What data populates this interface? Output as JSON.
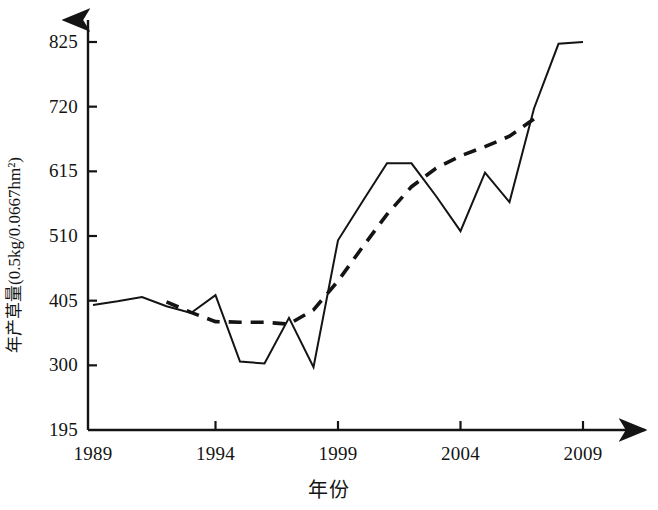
{
  "chart_data": {
    "type": "line",
    "title": "",
    "xlabel": "年份",
    "ylabel": "年产草量(0.5kg/0.0667hm²)",
    "xlim": [
      1989,
      2009
    ],
    "ylim": [
      195,
      825
    ],
    "grid": false,
    "legend": "none",
    "x_ticks": [
      "1989",
      "1994",
      "1999",
      "2004",
      "2009"
    ],
    "y_ticks": [
      "195",
      "300",
      "405",
      "510",
      "615",
      "720",
      "825"
    ],
    "x": [
      1989,
      1990,
      1991,
      1992,
      1993,
      1994,
      1995,
      1996,
      1997,
      1998,
      1999,
      2000,
      2001,
      2002,
      2003,
      2004,
      2005,
      2006,
      2007,
      2008,
      2009
    ],
    "series": [
      {
        "name": "年产草量",
        "style": "solid",
        "color": "#141414",
        "values": [
          398,
          404,
          411,
          396,
          385,
          414,
          306,
          303,
          377,
          297,
          503,
          566,
          628,
          628,
          575,
          518,
          613,
          565,
          717,
          822,
          825
        ]
      },
      {
        "name": "趋势线",
        "style": "dashed",
        "color": "#141414",
        "values": [
          null,
          null,
          null,
          403,
          386,
          371,
          370,
          370,
          367,
          390,
          437,
          492,
          545,
          590,
          620,
          640,
          655,
          672,
          700,
          null,
          null
        ]
      }
    ]
  },
  "axis": {
    "x_title": "年份",
    "y_title": "年产草量(0.5kg/0.0667hm²)"
  }
}
